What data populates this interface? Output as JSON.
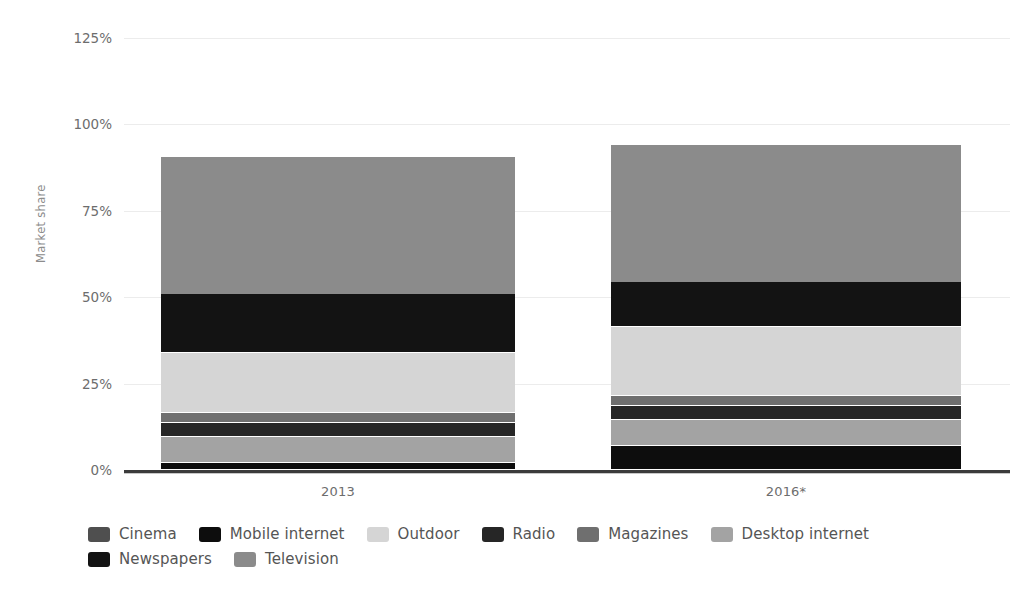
{
  "chart_data": {
    "type": "bar",
    "subtype": "stacked-100-percent",
    "title": "",
    "xlabel": "",
    "ylabel": "Market share",
    "ylim": [
      0,
      125
    ],
    "ytick_labels": [
      "0%",
      "25%",
      "50%",
      "75%",
      "100%",
      "125%"
    ],
    "ytick_values": [
      0,
      25,
      50,
      75,
      100,
      125
    ],
    "grid": true,
    "legend_position": "bottom",
    "categories": [
      "2013",
      "2016*"
    ],
    "series": [
      {
        "name": "Cinema",
        "color": "#4f4f4f",
        "values": [
          0.0,
          0.0
        ]
      },
      {
        "name": "Mobile internet",
        "color": "#0d0d0d",
        "values": [
          2.0,
          7.0
        ]
      },
      {
        "name": "Outdoor",
        "color": "#d5d5d5",
        "values": [
          17.5,
          20.0
        ]
      },
      {
        "name": "Radio",
        "color": "#262626",
        "values": [
          4.0,
          4.0
        ]
      },
      {
        "name": "Magazines",
        "color": "#6f6f6f",
        "values": [
          3.0,
          3.0
        ]
      },
      {
        "name": "Desktop internet",
        "color": "#a3a3a3",
        "values": [
          7.5,
          7.5
        ]
      },
      {
        "name": "Newspapers",
        "color": "#131313",
        "values": [
          17.0,
          13.0
        ]
      },
      {
        "name": "Television",
        "color": "#8b8b8b",
        "values": [
          39.5,
          39.5
        ]
      }
    ],
    "stack_order_bottom_to_top": [
      "Mobile internet",
      "Desktop internet",
      "Radio",
      "Magazines",
      "Outdoor",
      "Newspapers",
      "Television"
    ]
  },
  "axis": {
    "y_title": "Market share",
    "y_ticks": [
      "125%",
      "100%",
      "75%",
      "50%",
      "25%",
      "0%"
    ],
    "x_ticks": [
      "2013",
      "2016*"
    ]
  },
  "legend": {
    "items": [
      {
        "label": "Cinema",
        "color": "#4f4f4f"
      },
      {
        "label": "Mobile internet",
        "color": "#0d0d0d"
      },
      {
        "label": "Outdoor",
        "color": "#d5d5d5"
      },
      {
        "label": "Radio",
        "color": "#262626"
      },
      {
        "label": "Magazines",
        "color": "#6f6f6f"
      },
      {
        "label": "Desktop internet",
        "color": "#a3a3a3"
      },
      {
        "label": "Newspapers",
        "color": "#131313"
      },
      {
        "label": "Television",
        "color": "#8b8b8b"
      }
    ]
  }
}
